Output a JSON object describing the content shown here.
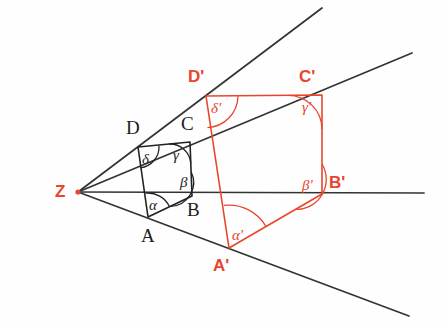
{
  "figure": {
    "colors": {
      "original_shape": "#222222",
      "image_shape": "#e8452c",
      "rays": "#333333",
      "background": "#ffffff"
    },
    "center": {
      "label": "Z",
      "x": 78,
      "y": 192
    },
    "original_polygon": {
      "name": "ABCD",
      "stroke": "#222222",
      "vertices": [
        {
          "label": "A",
          "x": 148,
          "y": 217,
          "label_x": 141,
          "label_y": 226
        },
        {
          "label": "B",
          "x": 192,
          "y": 196,
          "label_x": 187,
          "label_y": 200
        },
        {
          "label": "C",
          "x": 190,
          "y": 142,
          "label_x": 181,
          "label_y": 114
        },
        {
          "label": "D",
          "x": 138,
          "y": 147,
          "label_x": 126,
          "label_y": 118
        }
      ],
      "angles": [
        {
          "label": "α",
          "at": "A",
          "x": 149,
          "y": 198
        },
        {
          "label": "β",
          "at": "B",
          "x": 180,
          "y": 175
        },
        {
          "label": "γ",
          "at": "C",
          "x": 173,
          "y": 148
        },
        {
          "label": "δ",
          "at": "D",
          "x": 142,
          "y": 152
        }
      ]
    },
    "image_polygon": {
      "name": "A'B'C'D'",
      "stroke": "#e8452c",
      "vertices": [
        {
          "label": "A'",
          "x": 229,
          "y": 248,
          "label_x": 213,
          "label_y": 257
        },
        {
          "label": "B'",
          "x": 322,
          "y": 194,
          "label_x": 329,
          "label_y": 174
        },
        {
          "label": "C'",
          "x": 322,
          "y": 95,
          "label_x": 299,
          "label_y": 68
        },
        {
          "label": "D'",
          "x": 206,
          "y": 96,
          "label_x": 188,
          "label_y": 68
        }
      ],
      "angles": [
        {
          "label": "α'",
          "at": "A'",
          "x": 232,
          "y": 228
        },
        {
          "label": "β'",
          "at": "B'",
          "x": 302,
          "y": 178
        },
        {
          "label": "γ'",
          "at": "C'",
          "x": 302,
          "y": 100
        },
        {
          "label": "δ'",
          "at": "D'",
          "x": 211,
          "y": 101
        }
      ]
    },
    "rays": [
      {
        "name": "ray-Z-D-Dprime",
        "through": "D, D'",
        "x1": 78,
        "y1": 192,
        "x2": 322,
        "y2": 8
      },
      {
        "name": "ray-Z-C-Cprime",
        "through": "C, C'",
        "x1": 78,
        "y1": 192,
        "x2": 412,
        "y2": 53
      },
      {
        "name": "ray-Z-B-Bprime",
        "through": "B, B'",
        "x1": 78,
        "y1": 192,
        "x2": 424,
        "y2": 193
      },
      {
        "name": "ray-Z-A-Aprime",
        "through": "A, A'",
        "x1": 78,
        "y1": 192,
        "x2": 409,
        "y2": 316
      }
    ]
  }
}
